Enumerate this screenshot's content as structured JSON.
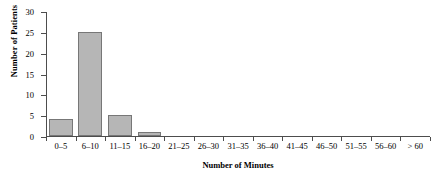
{
  "chart_data": {
    "type": "bar",
    "title": "",
    "xlabel": "Number of Minutes",
    "ylabel": "Number of Patients",
    "categories": [
      "0–5",
      "6–10",
      "11–15",
      "16–20",
      "21–25",
      "26–30",
      "31–35",
      "36–40",
      "41–45",
      "46–50",
      "51–55",
      "56–60",
      "> 60"
    ],
    "values": [
      4,
      25,
      5,
      1,
      0,
      0,
      0,
      0,
      0,
      0,
      0,
      0,
      0
    ],
    "ylim": [
      0,
      30
    ],
    "ytick_labels": [
      "0",
      "5",
      "10",
      "15",
      "20",
      "25",
      "30"
    ],
    "ytick_values": [
      0,
      5,
      10,
      15,
      20,
      25,
      30
    ],
    "grid": false,
    "legend": false,
    "bar_color": "#b6b6b6",
    "bar_edge_color": "#777777",
    "axis_color": "#4d4d4d"
  }
}
